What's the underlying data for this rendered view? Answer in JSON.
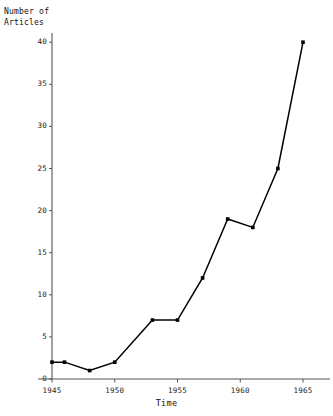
{
  "chart_data": {
    "type": "line",
    "title": "",
    "xlabel": "Time",
    "ylabel": "Number of\nArticles",
    "ylabel_line1": "Number of",
    "ylabel_line2": "Articles",
    "x": [
      1945,
      1946,
      1948,
      1950,
      1953,
      1955,
      1957,
      1959,
      1961,
      1963,
      1965
    ],
    "values": [
      2,
      2,
      1,
      2,
      7,
      7,
      12,
      19,
      18,
      25,
      40
    ],
    "series": [
      {
        "name": "Number of Articles",
        "points": [
          {
            "x": 1945,
            "y": 2
          },
          {
            "x": 1946,
            "y": 2
          },
          {
            "x": 1948,
            "y": 1
          },
          {
            "x": 1950,
            "y": 2
          },
          {
            "x": 1953,
            "y": 7
          },
          {
            "x": 1955,
            "y": 7
          },
          {
            "x": 1957,
            "y": 12
          },
          {
            "x": 1959,
            "y": 19
          },
          {
            "x": 1961,
            "y": 18
          },
          {
            "x": 1963,
            "y": 25
          },
          {
            "x": 1965,
            "y": 40
          }
        ]
      }
    ],
    "xlim": [
      1943.5,
      1966.5
    ],
    "ylim": [
      0,
      40
    ],
    "xticks": [
      1945,
      1950,
      1955,
      1960,
      1965
    ],
    "xtick_labels": [
      "1945",
      "1950",
      "1955",
      "1960",
      "1965"
    ],
    "yticks": [
      0,
      5,
      10,
      15,
      20,
      25,
      30,
      35,
      40
    ],
    "ytick_labels": [
      "0",
      "5",
      "10",
      "15",
      "20",
      "25",
      "30",
      "35",
      "40"
    ],
    "grid": false,
    "legend": "none",
    "marker": "square",
    "line_color": "#000000",
    "marker_color": "#000000",
    "axis_color": "#555555",
    "background": "#ffffff"
  }
}
